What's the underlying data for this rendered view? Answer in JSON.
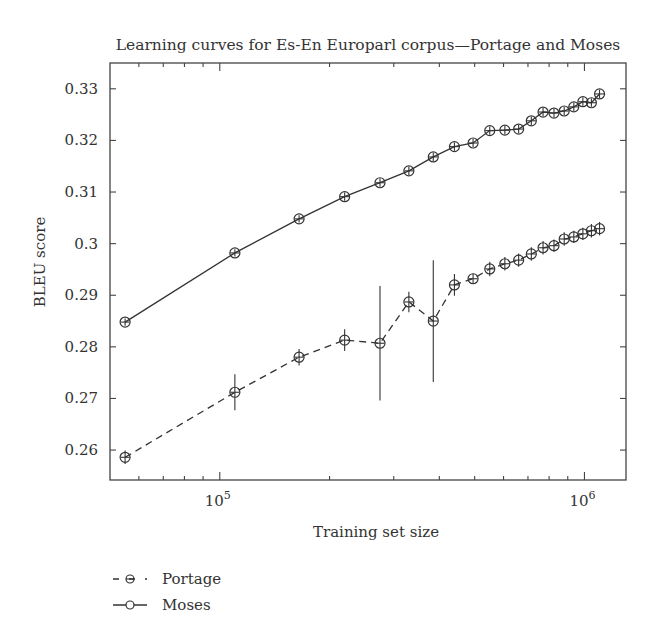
{
  "chart_data": {
    "type": "line",
    "title": "Learning curves for Es-En Europarl corpus—Portage and Moses",
    "xlabel": "Training set size",
    "ylabel": "BLEU score",
    "xscale": "log",
    "xlim": [
      50000,
      1300000
    ],
    "ylim": [
      0.2542,
      0.335
    ],
    "grid": false,
    "x_ticks": [
      {
        "value": 100000,
        "label_base": "10",
        "label_exp": "5"
      },
      {
        "value": 1000000,
        "label_base": "10",
        "label_exp": "6"
      }
    ],
    "x_minor_ticks": [
      60000,
      70000,
      80000,
      90000,
      200000,
      300000,
      400000,
      500000,
      600000,
      700000,
      800000,
      900000
    ],
    "y_ticks": [
      {
        "value": 0.26,
        "label": "0.26"
      },
      {
        "value": 0.27,
        "label": "0.27"
      },
      {
        "value": 0.28,
        "label": "0.28"
      },
      {
        "value": 0.29,
        "label": "0.29"
      },
      {
        "value": 0.3,
        "label": "0.3"
      },
      {
        "value": 0.31,
        "label": "0.31"
      },
      {
        "value": 0.32,
        "label": "0.32"
      },
      {
        "value": 0.33,
        "label": "0.33"
      }
    ],
    "legend_position": "below-left",
    "x": [
      55000,
      110000,
      165000,
      220000,
      275000,
      330000,
      385000,
      440000,
      495000,
      550000,
      605000,
      660000,
      715000,
      770000,
      825000,
      880000,
      935000,
      990000,
      1045000,
      1100000
    ],
    "series": [
      {
        "name": "Portage",
        "line_style": "dashed",
        "values": [
          0.2586,
          0.2712,
          0.278,
          0.2813,
          0.2807,
          0.2887,
          0.285,
          0.292,
          0.2932,
          0.2951,
          0.2961,
          0.2968,
          0.298,
          0.2992,
          0.2996,
          0.3009,
          0.3013,
          0.3019,
          0.3025,
          0.3029
        ],
        "errors": [
          0.0013,
          0.0035,
          0.0016,
          0.0021,
          0.0111,
          0.002,
          0.0118,
          0.0021,
          0.001,
          0.0014,
          0.0013,
          0.0013,
          0.0013,
          0.0013,
          0.0012,
          0.0013,
          0.0012,
          0.0012,
          0.0013,
          0.0013
        ]
      },
      {
        "name": "Moses",
        "line_style": "solid",
        "values": [
          0.2848,
          0.2982,
          0.3048,
          0.3091,
          0.3118,
          0.3141,
          0.3168,
          0.3188,
          0.3195,
          0.3219,
          0.322,
          0.3222,
          0.3238,
          0.3255,
          0.3253,
          0.3257,
          0.3265,
          0.3275,
          0.3273,
          0.329
        ],
        "errors": [
          0.0007,
          0.0007,
          0.0007,
          0.0008,
          0.0008,
          0.0008,
          0.0008,
          0.0008,
          0.0008,
          0.0008,
          0.0008,
          0.0008,
          0.0008,
          0.0008,
          0.0008,
          0.0008,
          0.0008,
          0.0008,
          0.0008,
          0.0008
        ]
      }
    ],
    "legend": [
      {
        "label": "Portage",
        "line_style": "dashed"
      },
      {
        "label": "Moses",
        "line_style": "solid"
      }
    ]
  }
}
